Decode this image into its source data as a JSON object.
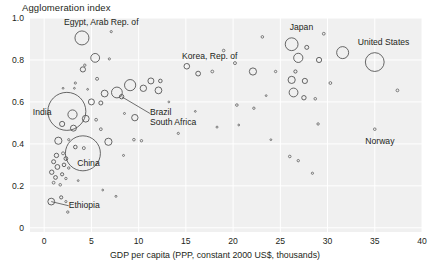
{
  "chart_data": {
    "type": "scatter",
    "title": "Agglomeration index",
    "xlabel": "GDP per capita (PPP, constant 2000 US$, thousands)",
    "ylabel": "Agglomeration index",
    "xlim": [
      -1.5,
      40
    ],
    "ylim": [
      -0.02,
      1.0
    ],
    "xticks": [
      "0",
      "5",
      "10",
      "15",
      "20",
      "25",
      "30",
      "35",
      "40"
    ],
    "xtick_values": [
      0,
      5,
      10,
      15,
      20,
      25,
      30,
      35,
      40
    ],
    "yticks": [
      "0",
      "0.2",
      "0.4",
      "0.6",
      "0.8",
      "1.0"
    ],
    "ytick_values": [
      0,
      0.2,
      0.4,
      0.6,
      0.8,
      1.0
    ],
    "grid": true,
    "legend": "none",
    "marker_style": "open-circle",
    "size_encoding": "population",
    "annotations": [
      {
        "label": "Egypt, Arab Rep. of",
        "x": 4.0,
        "y": 0.905,
        "lx": 2.1,
        "ly": 0.975,
        "leader": false
      },
      {
        "label": "India",
        "x": 2.4,
        "y": 0.555,
        "lx": -1.2,
        "ly": 0.545,
        "leader": false
      },
      {
        "label": "China",
        "x": 4.1,
        "y": 0.355,
        "lx": 3.5,
        "ly": 0.305,
        "leader": false
      },
      {
        "label": "Ethiopia",
        "x": 0.75,
        "y": 0.125,
        "lx": 2.6,
        "ly": 0.105,
        "leader": true
      },
      {
        "label": "Brazil",
        "x": 8.2,
        "y": 0.625,
        "lx": 11.2,
        "ly": 0.545,
        "leader": true
      },
      {
        "label": "South Africa",
        "x": 9.6,
        "y": 0.525,
        "lx": 11.2,
        "ly": 0.5,
        "leader": false
      },
      {
        "label": "Korea, Rep. of",
        "x": 19.0,
        "y": 0.845,
        "lx": 14.6,
        "ly": 0.815,
        "leader": false
      },
      {
        "label": "Japan",
        "x": 26.0,
        "y": 0.875,
        "lx": 26.0,
        "ly": 0.95,
        "leader": false
      },
      {
        "label": "United States",
        "x": 35.0,
        "y": 0.79,
        "lx": 33.2,
        "ly": 0.88,
        "leader": false
      },
      {
        "label": "Norway",
        "x": 35.0,
        "y": 0.47,
        "lx": 34.0,
        "ly": 0.41,
        "leader": false
      }
    ],
    "points": [
      {
        "x": 4.0,
        "y": 0.905,
        "r": 7.0
      },
      {
        "x": 7.1,
        "y": 0.935,
        "r": 1.1
      },
      {
        "x": 29.6,
        "y": 0.925,
        "r": 1.4
      },
      {
        "x": 26.2,
        "y": 0.875,
        "r": 6.4
      },
      {
        "x": 27.8,
        "y": 0.86,
        "r": 2.0
      },
      {
        "x": 23.1,
        "y": 0.91,
        "r": 1.3
      },
      {
        "x": 5.4,
        "y": 0.81,
        "r": 4.4
      },
      {
        "x": 6.9,
        "y": 0.805,
        "r": 1.1
      },
      {
        "x": 31.6,
        "y": 0.835,
        "r": 6.0
      },
      {
        "x": 35.0,
        "y": 0.79,
        "r": 9.4
      },
      {
        "x": 29.1,
        "y": 0.8,
        "r": 2.6
      },
      {
        "x": 26.9,
        "y": 0.81,
        "r": 4.6
      },
      {
        "x": 20.2,
        "y": 0.785,
        "r": 1.5
      },
      {
        "x": 19.0,
        "y": 0.845,
        "r": 1.3
      },
      {
        "x": 4.3,
        "y": 0.775,
        "r": 1.2
      },
      {
        "x": 4.1,
        "y": 0.755,
        "r": 2.6
      },
      {
        "x": 15.1,
        "y": 0.77,
        "r": 2.8
      },
      {
        "x": 16.3,
        "y": 0.735,
        "r": 2.4
      },
      {
        "x": 22.1,
        "y": 0.745,
        "r": 3.6
      },
      {
        "x": 17.8,
        "y": 0.745,
        "r": 1.4
      },
      {
        "x": 24.5,
        "y": 0.745,
        "r": 1.2
      },
      {
        "x": 5.6,
        "y": 0.71,
        "r": 1.5
      },
      {
        "x": 3.3,
        "y": 0.69,
        "r": 1.1
      },
      {
        "x": 11.3,
        "y": 0.7,
        "r": 3.0
      },
      {
        "x": 12.3,
        "y": 0.7,
        "r": 1.8
      },
      {
        "x": 26.2,
        "y": 0.705,
        "r": 3.6
      },
      {
        "x": 27.6,
        "y": 0.7,
        "r": 2.6
      },
      {
        "x": 26.6,
        "y": 0.745,
        "r": 1.6
      },
      {
        "x": 30.3,
        "y": 0.69,
        "r": 1.4
      },
      {
        "x": 2.0,
        "y": 0.665,
        "r": 0.9
      },
      {
        "x": 3.2,
        "y": 0.665,
        "r": 0.9
      },
      {
        "x": 4.6,
        "y": 0.66,
        "r": 0.9
      },
      {
        "x": 9.1,
        "y": 0.68,
        "r": 5.6
      },
      {
        "x": 10.5,
        "y": 0.665,
        "r": 3.2
      },
      {
        "x": 12.1,
        "y": 0.655,
        "r": 3.4
      },
      {
        "x": 7.7,
        "y": 0.645,
        "r": 5.4
      },
      {
        "x": 6.4,
        "y": 0.64,
        "r": 3.4
      },
      {
        "x": 26.4,
        "y": 0.645,
        "r": 4.4
      },
      {
        "x": 27.5,
        "y": 0.62,
        "r": 2.2
      },
      {
        "x": 28.7,
        "y": 0.615,
        "r": 1.3
      },
      {
        "x": 2.4,
        "y": 0.555,
        "r": 19.0
      },
      {
        "x": 5.0,
        "y": 0.6,
        "r": 3.0
      },
      {
        "x": 6.0,
        "y": 0.595,
        "r": 2.0
      },
      {
        "x": 8.2,
        "y": 0.625,
        "r": 2.2
      },
      {
        "x": 37.4,
        "y": 0.655,
        "r": 1.4
      },
      {
        "x": 20.4,
        "y": 0.585,
        "r": 1.3
      },
      {
        "x": 22.2,
        "y": 0.57,
        "r": 1.2
      },
      {
        "x": 3.0,
        "y": 0.54,
        "r": 4.6
      },
      {
        "x": 4.4,
        "y": 0.52,
        "r": 3.4
      },
      {
        "x": 5.5,
        "y": 0.515,
        "r": 1.4
      },
      {
        "x": 9.6,
        "y": 0.525,
        "r": 3.2
      },
      {
        "x": 8.5,
        "y": 0.545,
        "r": 1.0
      },
      {
        "x": 1.9,
        "y": 0.495,
        "r": 2.6
      },
      {
        "x": 3.1,
        "y": 0.475,
        "r": 3.0
      },
      {
        "x": 6.0,
        "y": 0.47,
        "r": 1.4
      },
      {
        "x": 35.0,
        "y": 0.47,
        "r": 1.3
      },
      {
        "x": 29.0,
        "y": 0.495,
        "r": 1.2
      },
      {
        "x": 4.1,
        "y": 0.355,
        "r": 17.5
      },
      {
        "x": 1.5,
        "y": 0.415,
        "r": 3.6
      },
      {
        "x": 2.6,
        "y": 0.42,
        "r": 1.1
      },
      {
        "x": 6.8,
        "y": 0.41,
        "r": 3.6
      },
      {
        "x": 9.5,
        "y": 0.42,
        "r": 1.3
      },
      {
        "x": 3.3,
        "y": 0.385,
        "r": 1.8
      },
      {
        "x": 4.2,
        "y": 0.38,
        "r": 1.5
      },
      {
        "x": 2.0,
        "y": 0.355,
        "r": 1.5
      },
      {
        "x": 1.3,
        "y": 0.345,
        "r": 2.2
      },
      {
        "x": 2.3,
        "y": 0.33,
        "r": 1.9
      },
      {
        "x": 8.4,
        "y": 0.345,
        "r": 1.0
      },
      {
        "x": 1.0,
        "y": 0.315,
        "r": 2.0
      },
      {
        "x": 2.1,
        "y": 0.3,
        "r": 1.8
      },
      {
        "x": 1.4,
        "y": 0.29,
        "r": 2.4
      },
      {
        "x": 2.6,
        "y": 0.285,
        "r": 1.2
      },
      {
        "x": 0.8,
        "y": 0.265,
        "r": 2.2
      },
      {
        "x": 1.9,
        "y": 0.255,
        "r": 1.6
      },
      {
        "x": 1.2,
        "y": 0.24,
        "r": 1.9
      },
      {
        "x": 2.3,
        "y": 0.235,
        "r": 1.2
      },
      {
        "x": 3.6,
        "y": 0.225,
        "r": 0.9
      },
      {
        "x": 1.0,
        "y": 0.215,
        "r": 1.4
      },
      {
        "x": 1.7,
        "y": 0.205,
        "r": 1.3
      },
      {
        "x": 6.2,
        "y": 0.18,
        "r": 0.9
      },
      {
        "x": 7.6,
        "y": 0.15,
        "r": 1.0
      },
      {
        "x": 0.75,
        "y": 0.125,
        "r": 3.4
      },
      {
        "x": 1.8,
        "y": 0.145,
        "r": 1.6
      },
      {
        "x": 2.3,
        "y": 0.125,
        "r": 1.1
      },
      {
        "x": 2.5,
        "y": 0.075,
        "r": 1.2
      },
      {
        "x": 16.0,
        "y": 0.555,
        "r": 0.9
      },
      {
        "x": 18.3,
        "y": 0.48,
        "r": 1.0
      },
      {
        "x": 14.2,
        "y": 0.45,
        "r": 1.1
      },
      {
        "x": 10.3,
        "y": 0.415,
        "r": 1.2
      },
      {
        "x": 26.0,
        "y": 0.34,
        "r": 1.3
      },
      {
        "x": 26.9,
        "y": 0.32,
        "r": 1.2
      },
      {
        "x": 28.4,
        "y": 0.26,
        "r": 1.1
      },
      {
        "x": 24.0,
        "y": 0.42,
        "r": 0.9
      },
      {
        "x": 20.6,
        "y": 0.49,
        "r": 0.9
      },
      {
        "x": 13.2,
        "y": 0.6,
        "r": 0.9
      },
      {
        "x": 23.5,
        "y": 0.63,
        "r": 0.9
      }
    ]
  },
  "source": {
    "text": ""
  }
}
